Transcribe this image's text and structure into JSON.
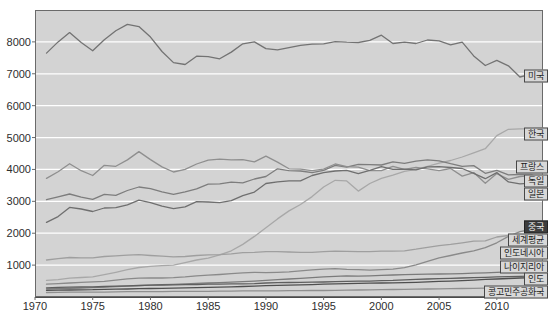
{
  "chart_data": {
    "type": "line",
    "title": "",
    "xlabel": "",
    "ylabel": "",
    "x_range": [
      1970,
      2014
    ],
    "y_range": [
      0,
      9000
    ],
    "x_ticks": [
      1970,
      1975,
      1980,
      1985,
      1990,
      1995,
      2000,
      2005,
      2010
    ],
    "y_ticks": [
      1000,
      2000,
      3000,
      4000,
      5000,
      6000,
      7000,
      8000
    ],
    "grid": true,
    "legend_position": "right-edge-boxed-labels",
    "plot_bg": "#d3d3d3",
    "grid_color": "#ffffff",
    "border_color": "#6a6a6a",
    "tick_label_color": "#2e2e2e",
    "label_box": {
      "bg": "#d8d8d8",
      "border": "#474747",
      "text": "#1c1c1c",
      "highlight_bg": "#3d3d3d",
      "highlight_text": "#f2f2f2"
    },
    "start_year": 1971,
    "series": [
      {
        "name": "미국",
        "key": "usa",
        "color": "#737373",
        "label_y": 76,
        "highlight": false,
        "values": [
          7650,
          8000,
          8290,
          7980,
          7720,
          8070,
          8350,
          8550,
          8480,
          8150,
          7700,
          7350,
          7290,
          7550,
          7540,
          7470,
          7680,
          7940,
          8000,
          7790,
          7750,
          7820,
          7890,
          7930,
          7940,
          8010,
          7990,
          7980,
          8050,
          8210,
          7950,
          7990,
          7950,
          8060,
          8030,
          7910,
          7990,
          7560,
          7260,
          7420,
          7250,
          6900,
          6990,
          6930
        ]
      },
      {
        "name": "한국",
        "key": "korea",
        "color": "#a8a8a8",
        "label_y": 134,
        "highlight": false,
        "values": [
          520,
          545,
          590,
          610,
          630,
          700,
          775,
          855,
          925,
          960,
          980,
          1000,
          1080,
          1160,
          1220,
          1320,
          1450,
          1650,
          1900,
          2170,
          2450,
          2700,
          2900,
          3150,
          3450,
          3660,
          3640,
          3320,
          3560,
          3720,
          3820,
          3940,
          4000,
          4100,
          4200,
          4280,
          4390,
          4520,
          4650,
          5060,
          5260,
          5270,
          5280,
          5300
        ]
      },
      {
        "name": "프랑스",
        "key": "france",
        "color": "#7d7d7d",
        "label_y": 167,
        "highlight": false,
        "values": [
          3050,
          3140,
          3230,
          3130,
          3060,
          3220,
          3190,
          3340,
          3450,
          3400,
          3300,
          3220,
          3300,
          3390,
          3540,
          3550,
          3600,
          3580,
          3700,
          3780,
          4020,
          3960,
          3950,
          3900,
          3970,
          4130,
          4070,
          4160,
          4150,
          4140,
          4240,
          4190,
          4260,
          4300,
          4270,
          4180,
          4100,
          4120,
          3880,
          3970,
          3830,
          3840,
          3840,
          3660
        ]
      },
      {
        "name": "독일",
        "key": "germany",
        "color": "#8f8f8f",
        "label_y": 181,
        "highlight": false,
        "values": [
          3720,
          3930,
          4180,
          3960,
          3810,
          4130,
          4100,
          4300,
          4560,
          4310,
          4080,
          3920,
          4000,
          4170,
          4290,
          4320,
          4300,
          4310,
          4240,
          4420,
          4230,
          4020,
          4010,
          3960,
          4010,
          4170,
          4090,
          4070,
          3960,
          3960,
          4100,
          4000,
          4060,
          4020,
          3960,
          4030,
          3790,
          3900,
          3570,
          3870,
          3690,
          3780,
          3810,
          3650
        ]
      },
      {
        "name": "일본",
        "key": "japan",
        "color": "#6f6f6f",
        "label_y": 194,
        "highlight": false,
        "values": [
          2340,
          2520,
          2810,
          2760,
          2680,
          2790,
          2800,
          2890,
          3040,
          2960,
          2850,
          2770,
          2830,
          2990,
          2980,
          2960,
          3020,
          3180,
          3290,
          3560,
          3610,
          3640,
          3640,
          3810,
          3900,
          3950,
          3970,
          3870,
          3970,
          4090,
          4000,
          4010,
          3990,
          4080,
          4090,
          4060,
          4030,
          3880,
          3710,
          3900,
          3610,
          3550,
          3570,
          3470
        ]
      },
      {
        "name": "중국",
        "key": "china",
        "color": "#8a8a8a",
        "label_y": 227,
        "highlight": true,
        "values": [
          400,
          420,
          440,
          460,
          475,
          490,
          530,
          570,
          590,
          600,
          595,
          605,
          630,
          665,
          685,
          705,
          730,
          760,
          770,
          765,
          775,
          790,
          820,
          850,
          875,
          890,
          870,
          855,
          845,
          860,
          875,
          920,
          1010,
          1120,
          1230,
          1300,
          1380,
          1450,
          1550,
          1700,
          1900,
          2050,
          2120,
          2190
        ]
      },
      {
        "name": "세계평균",
        "key": "world",
        "color": "#9f9f9f",
        "label_y": 240,
        "highlight": false,
        "values": [
          1160,
          1200,
          1240,
          1230,
          1230,
          1270,
          1290,
          1310,
          1330,
          1300,
          1280,
          1260,
          1270,
          1300,
          1320,
          1330,
          1350,
          1390,
          1400,
          1420,
          1420,
          1410,
          1400,
          1400,
          1420,
          1440,
          1430,
          1420,
          1420,
          1440,
          1440,
          1450,
          1500,
          1560,
          1610,
          1650,
          1700,
          1750,
          1760,
          1880,
          1930,
          1940,
          1950,
          1960
        ]
      },
      {
        "name": "인도네시아",
        "key": "indonesia",
        "color": "#7b7b7b",
        "label_y": 253,
        "highlight": false,
        "values": [
          250,
          260,
          270,
          280,
          295,
          310,
          325,
          340,
          355,
          370,
          385,
          395,
          410,
          425,
          440,
          450,
          465,
          480,
          500,
          525,
          545,
          565,
          585,
          605,
          630,
          650,
          665,
          655,
          665,
          680,
          690,
          700,
          710,
          715,
          720,
          725,
          735,
          745,
          755,
          770,
          790,
          800,
          790,
          780
        ]
      },
      {
        "name": "나이지리아",
        "key": "nigeria",
        "color": "#5f5f5f",
        "label_y": 267,
        "highlight": false,
        "values": [
          290,
          300,
          310,
          315,
          320,
          330,
          340,
          350,
          360,
          370,
          375,
          380,
          385,
          390,
          400,
          405,
          410,
          415,
          420,
          440,
          450,
          455,
          460,
          465,
          470,
          480,
          490,
          495,
          500,
          510,
          520,
          540,
          555,
          565,
          575,
          585,
          595,
          605,
          615,
          630,
          640,
          650,
          655,
          660
        ]
      },
      {
        "name": "인도",
        "key": "india",
        "color": "#4f4f4f",
        "label_y": 279,
        "highlight": false,
        "values": [
          210,
          215,
          220,
          225,
          230,
          240,
          245,
          250,
          260,
          265,
          270,
          280,
          285,
          295,
          305,
          310,
          320,
          330,
          340,
          355,
          365,
          370,
          380,
          390,
          400,
          410,
          420,
          425,
          435,
          440,
          445,
          450,
          460,
          475,
          490,
          500,
          510,
          530,
          555,
          565,
          580,
          595,
          605,
          620
        ]
      },
      {
        "name": "콩고민주공화국",
        "key": "drcongo",
        "color": "#8f8f8f",
        "label_y": 292,
        "highlight": false,
        "values": [
          140,
          145,
          150,
          150,
          155,
          155,
          160,
          165,
          165,
          170,
          170,
          175,
          175,
          180,
          180,
          185,
          185,
          190,
          190,
          195,
          195,
          200,
          200,
          205,
          205,
          210,
          215,
          220,
          225,
          230,
          235,
          240,
          245,
          250,
          255,
          260,
          265,
          270,
          275,
          280,
          285,
          290,
          295,
          300
        ]
      }
    ]
  }
}
